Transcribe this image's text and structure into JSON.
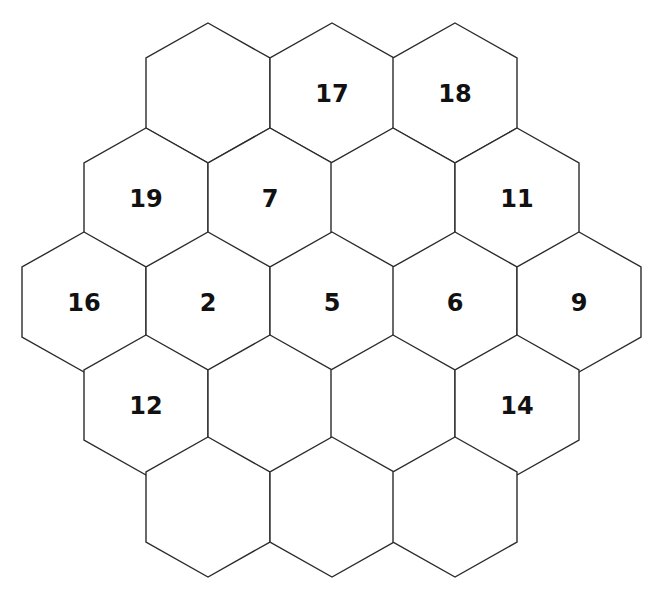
{
  "puzzle": {
    "type": "hexagonal-grid",
    "rows": [
      {
        "cells": [
          {
            "label": ""
          },
          {
            "label": "17"
          },
          {
            "label": "18"
          }
        ]
      },
      {
        "cells": [
          {
            "label": "19"
          },
          {
            "label": "7"
          },
          {
            "label": ""
          },
          {
            "label": "11"
          }
        ]
      },
      {
        "cells": [
          {
            "label": "16"
          },
          {
            "label": "2"
          },
          {
            "label": "5"
          },
          {
            "label": "6"
          },
          {
            "label": "9"
          }
        ]
      },
      {
        "cells": [
          {
            "label": "12"
          },
          {
            "label": ""
          },
          {
            "label": ""
          },
          {
            "label": "14"
          }
        ]
      },
      {
        "cells": [
          {
            "label": ""
          },
          {
            "label": ""
          },
          {
            "label": ""
          }
        ]
      }
    ],
    "colors": {
      "stroke": "#2b2b2b",
      "fill": "#ffffff",
      "text": "#111111"
    }
  }
}
